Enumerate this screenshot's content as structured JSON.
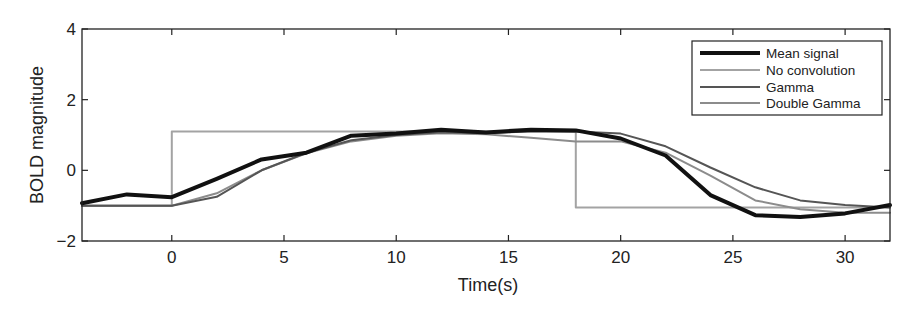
{
  "chart_data": {
    "type": "line",
    "title": "",
    "xlabel": "Time(s)",
    "ylabel": "BOLD magnitude",
    "xlim": [
      -4,
      32
    ],
    "ylim": [
      -2,
      4
    ],
    "xticks": [
      0,
      5,
      10,
      15,
      20,
      25,
      30
    ],
    "yticks": [
      -2,
      0,
      2,
      4
    ],
    "xtick_labels": [
      "0",
      "5",
      "10",
      "15",
      "20",
      "25",
      "30"
    ],
    "ytick_labels": [
      "−2",
      "0",
      "2",
      "4"
    ],
    "grid": false,
    "legend_position": "upper right",
    "series": [
      {
        "name": "Mean signal",
        "color": "#111111",
        "width": 4,
        "x": [
          -4,
          -2,
          0,
          2,
          4,
          6,
          8,
          10,
          12,
          14,
          16,
          18,
          20,
          22,
          24,
          26,
          28,
          30,
          32
        ],
        "y": [
          -0.93,
          -0.68,
          -0.76,
          -0.24,
          0.31,
          0.5,
          0.98,
          1.04,
          1.15,
          1.07,
          1.15,
          1.13,
          0.9,
          0.42,
          -0.7,
          -1.27,
          -1.32,
          -1.22,
          -0.98
        ]
      },
      {
        "name": "No convolution",
        "color": "#a3a3a3",
        "width": 2,
        "x": [
          -4,
          0,
          0,
          18,
          18,
          32
        ],
        "y": [
          -1.0,
          -1.0,
          1.1,
          1.1,
          -1.05,
          -1.05
        ]
      },
      {
        "name": "Gamma",
        "color": "#555555",
        "width": 2,
        "x": [
          -4,
          0,
          2,
          4,
          6,
          8,
          10,
          12,
          14,
          16,
          18,
          20,
          22,
          24,
          26,
          28,
          30,
          32
        ],
        "y": [
          -1.0,
          -1.0,
          -0.75,
          0.0,
          0.5,
          0.85,
          1.0,
          1.08,
          1.05,
          1.1,
          1.1,
          1.04,
          0.68,
          0.08,
          -0.48,
          -0.85,
          -0.98,
          -1.05
        ]
      },
      {
        "name": "Double Gamma",
        "color": "#8c8c8c",
        "width": 2,
        "x": [
          -4,
          0,
          2,
          4,
          6,
          8,
          10,
          12,
          14,
          16,
          18,
          20,
          22,
          24,
          26,
          28,
          30,
          32
        ],
        "y": [
          -1.0,
          -1.0,
          -0.65,
          0.0,
          0.48,
          0.82,
          0.98,
          1.05,
          1.02,
          0.92,
          0.82,
          0.82,
          0.5,
          -0.15,
          -0.85,
          -1.1,
          -1.2,
          -1.2
        ]
      }
    ]
  },
  "plot_area": {
    "left": 82,
    "top": 29,
    "right": 890,
    "bottom": 241
  }
}
